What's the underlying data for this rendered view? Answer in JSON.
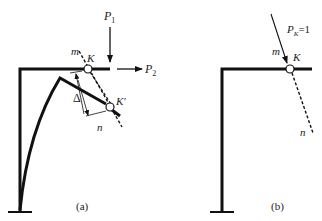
{
  "figure": {
    "panel_a": {
      "caption": "(a)",
      "labels": {
        "force1": "P",
        "force1_sub": "1",
        "force2": "P",
        "force2_sub": "2",
        "point_k": "K",
        "point_k_prime": "K′",
        "line_m": "m",
        "line_n": "n",
        "displacement": "Δ"
      }
    },
    "panel_b": {
      "caption": "(b)",
      "labels": {
        "unit_force": "P",
        "unit_force_sub": "K",
        "unit_force_value": "=1",
        "point_k": "K",
        "line_m": "m",
        "line_n": "n"
      }
    },
    "colors": {
      "stroke": "#111111",
      "text": "#222222",
      "background": "#ffffff"
    }
  }
}
